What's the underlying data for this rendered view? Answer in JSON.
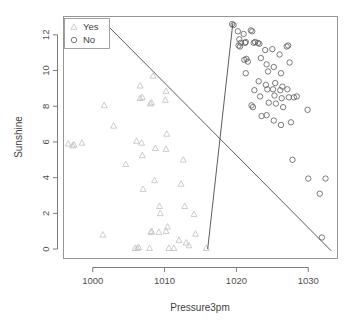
{
  "chart_data": {
    "type": "scatter",
    "title": "",
    "xlabel": "Pressure3pm",
    "ylabel": "Sunshine",
    "xlim": [
      996,
      1034
    ],
    "ylim": [
      -0.5,
      13.0
    ],
    "xticks": [
      1000,
      1010,
      1020,
      1030
    ],
    "yticks": [
      0,
      2,
      4,
      6,
      8,
      10,
      12
    ],
    "grid": false,
    "legend_position": "top-left",
    "legend": [
      {
        "label": "Yes",
        "marker": "triangle",
        "color": "#c0c0c0"
      },
      {
        "label": "No",
        "marker": "circle",
        "color": "#5a5a5a"
      }
    ],
    "series": [
      {
        "name": "Yes",
        "marker": "triangle",
        "color": "#c0c0c0",
        "points": [
          [
            996.6,
            5.9
          ],
          [
            997.2,
            5.8
          ],
          [
            997.4,
            5.85
          ],
          [
            998.5,
            5.95
          ],
          [
            1001.4,
            0.8
          ],
          [
            1001.6,
            8.05
          ],
          [
            1002.9,
            6.9
          ],
          [
            1004.6,
            4.75
          ],
          [
            1005.9,
            0.05
          ],
          [
            1006.2,
            0.05
          ],
          [
            1006.4,
            0.1
          ],
          [
            1006.1,
            6.05
          ],
          [
            1006.6,
            8.45
          ],
          [
            1006.9,
            8.5
          ],
          [
            1006.8,
            5.95
          ],
          [
            1006.6,
            9.15
          ],
          [
            1007.0,
            3.35
          ],
          [
            1006.9,
            5.25
          ],
          [
            1007.9,
            0.05
          ],
          [
            1008.0,
            8.15
          ],
          [
            1008.2,
            8.2
          ],
          [
            1008.4,
            9.7
          ],
          [
            1008.2,
            1.0
          ],
          [
            1008.1,
            0.95
          ],
          [
            1008.7,
            5.65
          ],
          [
            1008.6,
            3.85
          ],
          [
            1009.3,
            2.4
          ],
          [
            1009.4,
            2.0
          ],
          [
            1009.2,
            0.95
          ],
          [
            1010.1,
            8.35
          ],
          [
            1010.2,
            8.85
          ],
          [
            1010.3,
            6.45
          ],
          [
            1010.2,
            5.6
          ],
          [
            1010.4,
            1.25
          ],
          [
            1010.2,
            1.0
          ],
          [
            1010.6,
            0.05
          ],
          [
            1011.3,
            0.05
          ],
          [
            1012.0,
            0.5
          ],
          [
            1012.3,
            3.65
          ],
          [
            1012.6,
            5.0
          ],
          [
            1012.8,
            2.4
          ],
          [
            1013.0,
            0.35
          ],
          [
            1013.4,
            0.2
          ],
          [
            1014.1,
            1.95
          ],
          [
            1014.3,
            0.85
          ],
          [
            1015.8,
            0.05
          ]
        ]
      },
      {
        "name": "No",
        "marker": "circle",
        "color": "#5a5a5a",
        "points": [
          [
            1019.4,
            12.6
          ],
          [
            1019.6,
            12.55
          ],
          [
            1020.2,
            12.2
          ],
          [
            1020.4,
            11.75
          ],
          [
            1020.3,
            11.4
          ],
          [
            1020.5,
            11.35
          ],
          [
            1020.6,
            11.55
          ],
          [
            1021.0,
            12.05
          ],
          [
            1021.2,
            11.55
          ],
          [
            1021.3,
            11.6
          ],
          [
            1021.1,
            10.6
          ],
          [
            1021.4,
            10.65
          ],
          [
            1021.6,
            10.5
          ],
          [
            1021.3,
            9.85
          ],
          [
            1022.0,
            12.25
          ],
          [
            1022.2,
            12.2
          ],
          [
            1022.4,
            11.55
          ],
          [
            1022.6,
            11.6
          ],
          [
            1022.1,
            8.05
          ],
          [
            1022.3,
            7.95
          ],
          [
            1022.5,
            8.9
          ],
          [
            1023.0,
            11.55
          ],
          [
            1023.2,
            11.5
          ],
          [
            1023.4,
            10.7
          ],
          [
            1023.1,
            9.4
          ],
          [
            1023.3,
            8.55
          ],
          [
            1023.5,
            7.45
          ],
          [
            1024.0,
            11.15
          ],
          [
            1024.2,
            10.35
          ],
          [
            1024.4,
            9.95
          ],
          [
            1024.1,
            9.2
          ],
          [
            1024.3,
            8.95
          ],
          [
            1024.5,
            8.2
          ],
          [
            1024.2,
            7.5
          ],
          [
            1025.0,
            11.2
          ],
          [
            1025.2,
            10.2
          ],
          [
            1025.4,
            9.3
          ],
          [
            1025.1,
            8.95
          ],
          [
            1025.3,
            8.6
          ],
          [
            1025.5,
            8.15
          ],
          [
            1025.2,
            7.2
          ],
          [
            1026.0,
            10.9
          ],
          [
            1026.2,
            9.85
          ],
          [
            1026.4,
            9.1
          ],
          [
            1026.1,
            8.9
          ],
          [
            1026.3,
            8.45
          ],
          [
            1026.5,
            7.95
          ],
          [
            1026.2,
            6.95
          ],
          [
            1027.0,
            11.35
          ],
          [
            1027.2,
            11.4
          ],
          [
            1027.4,
            10.45
          ],
          [
            1027.1,
            8.95
          ],
          [
            1027.3,
            8.5
          ],
          [
            1027.6,
            7.1
          ],
          [
            1028.0,
            8.5
          ],
          [
            1028.4,
            8.55
          ],
          [
            1027.8,
            5.0
          ],
          [
            1029.9,
            7.8
          ],
          [
            1030.0,
            3.95
          ],
          [
            1031.6,
            3.1
          ],
          [
            1032.4,
            3.95
          ],
          [
            1031.9,
            0.65
          ]
        ]
      }
    ],
    "decision_lines": [
      {
        "name": "diagonal-boundary",
        "p1": [
          1001.5,
          12.75
        ],
        "p2": [
          1033.2,
          -0.1
        ]
      },
      {
        "name": "steep-boundary",
        "p1": [
          1019.5,
          12.65
        ],
        "p2": [
          1016.0,
          0.0
        ]
      }
    ]
  }
}
